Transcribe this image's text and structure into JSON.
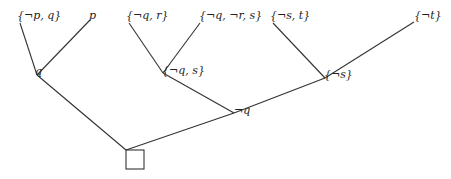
{
  "diagram": {
    "type": "resolution-tree",
    "line_color": "#333333",
    "nodes": [
      {
        "id": "n1",
        "label": "{¬p, q}",
        "x": 20,
        "y": 23,
        "lx": 17,
        "ly": 10
      },
      {
        "id": "n2",
        "label": "p",
        "x": 90,
        "y": 20,
        "lx": 89,
        "ly": 10
      },
      {
        "id": "n3",
        "label": "q",
        "x": 37,
        "y": 75,
        "lx": 35,
        "ly": 66
      },
      {
        "id": "n4",
        "label": "{¬q, r}",
        "x": 129,
        "y": 23,
        "lx": 126,
        "ly": 10
      },
      {
        "id": "n5",
        "label": "{¬q, ¬r, s}",
        "x": 200,
        "y": 23,
        "lx": 199,
        "ly": 10
      },
      {
        "id": "n6",
        "label": "{¬q, s}",
        "x": 163,
        "y": 73,
        "lx": 162,
        "ly": 65
      },
      {
        "id": "n7",
        "label": "¬q",
        "x": 234,
        "y": 113,
        "lx": 234,
        "ly": 105
      },
      {
        "id": "n8",
        "label": "{¬s, t}",
        "x": 273,
        "y": 23,
        "lx": 270,
        "ly": 10
      },
      {
        "id": "n9",
        "label": "{¬t}",
        "x": 414,
        "y": 22,
        "lx": 414,
        "ly": 10
      },
      {
        "id": "n10",
        "label": "{¬s}",
        "x": 325,
        "y": 78,
        "lx": 324,
        "ly": 69
      },
      {
        "id": "n11",
        "label": "□",
        "x": 126,
        "y": 150,
        "box": true
      }
    ],
    "edges": [
      {
        "from": "n1",
        "to": "n3"
      },
      {
        "from": "n2",
        "to": "n3"
      },
      {
        "from": "n4",
        "to": "n6"
      },
      {
        "from": "n5",
        "to": "n6"
      },
      {
        "from": "n6",
        "to": "n7"
      },
      {
        "from": "n8",
        "to": "n10"
      },
      {
        "from": "n9",
        "to": "n10"
      },
      {
        "from": "n10",
        "to": "n7"
      },
      {
        "from": "n3",
        "to": "n11"
      },
      {
        "from": "n7",
        "to": "n11"
      }
    ],
    "empty_clause_box": {
      "x": 126,
      "y": 150,
      "w": 18,
      "h": 19
    }
  }
}
